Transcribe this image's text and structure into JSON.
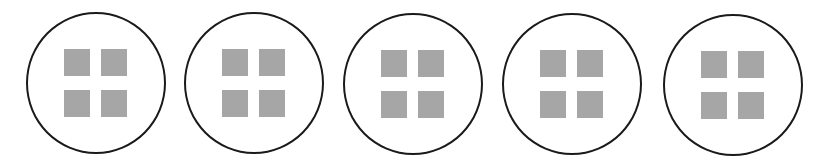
{
  "diagram": {
    "colors": {
      "background": "#ffffff",
      "circle_stroke": "#1a1a1a",
      "square_fill": "#a6a6a6"
    },
    "circles": [
      {
        "id": 1,
        "cx": 96,
        "cy": 83,
        "squares": 4
      },
      {
        "id": 2,
        "cx": 254,
        "cy": 83,
        "squares": 4
      },
      {
        "id": 3,
        "cx": 413,
        "cy": 84,
        "squares": 4
      },
      {
        "id": 4,
        "cx": 572,
        "cy": 84,
        "squares": 4
      },
      {
        "id": 5,
        "cx": 733,
        "cy": 85,
        "squares": 4
      }
    ]
  }
}
